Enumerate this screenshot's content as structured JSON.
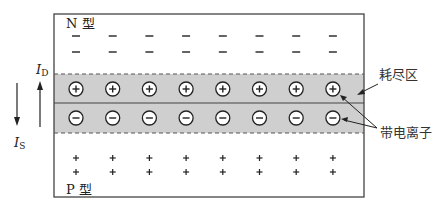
{
  "diagram": {
    "type": "pn-junction-depletion-region",
    "n_region": {
      "label": "N 型",
      "carrier_sign": "−",
      "rows": 2,
      "columns": 8
    },
    "p_region": {
      "label": "P 型",
      "carrier_sign": "+",
      "rows": 2,
      "columns": 8
    },
    "depletion_region": {
      "label": "耗尽区",
      "positive_ion_sign": "+",
      "negative_ion_sign": "−",
      "ion_count_per_row": 8
    },
    "ion_label": "带电离子",
    "currents": {
      "drift": {
        "label_main": "I",
        "label_sub": "D",
        "direction": "up"
      },
      "diffusion": {
        "label_main": "I",
        "label_sub": "S",
        "direction": "down"
      }
    },
    "colors": {
      "depletion_fill": "#cfcfcf",
      "border": "#444444",
      "ion_fill": "#ffffff",
      "text": "#222222"
    }
  }
}
